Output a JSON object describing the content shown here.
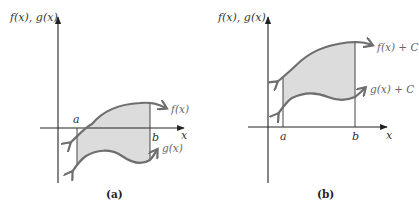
{
  "figure": {
    "panels": [
      {
        "id": "a",
        "caption": "(a)",
        "y_axis_label": "f(x), g(x)",
        "x_axis_label": "x",
        "bound_left": "a",
        "bound_right": "b",
        "upper_curve_label": "f(x)",
        "lower_curve_label": "g(x)",
        "description": "Shaded region between f(x) and g(x) from a to b, partly below the x-axis"
      },
      {
        "id": "b",
        "caption": "(b)",
        "y_axis_label": "f(x), g(x)",
        "x_axis_label": "x",
        "bound_left": "a",
        "bound_right": "b",
        "upper_curve_label": "f(x) + C",
        "lower_curve_label": "g(x) + C",
        "description": "Same region shifted upward by C so it lies entirely above the x-axis"
      }
    ],
    "colors": {
      "curve": "#6e6e6e",
      "shading": "#dcdcdc",
      "axis": "#222222"
    }
  }
}
